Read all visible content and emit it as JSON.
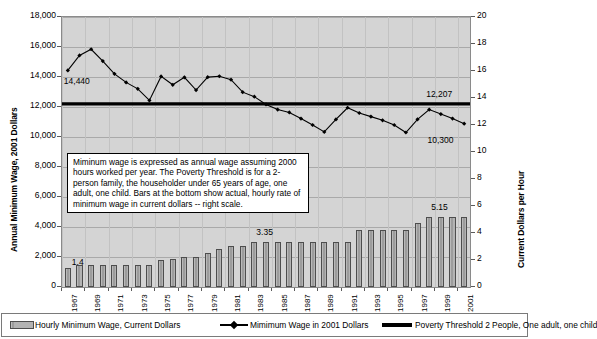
{
  "chart_data": {
    "type": "bar",
    "title": "",
    "xlabel": "",
    "ylabel": "Annual Minimum Wage, 2001 Dollars",
    "y2label": "Current Dollars per Hour",
    "ylim": [
      0,
      18000
    ],
    "y2lim": [
      0,
      20
    ],
    "grid": true,
    "legend_position": "bottom",
    "categories": [
      "1967",
      "1968",
      "1969",
      "1970",
      "1971",
      "1972",
      "1973",
      "1974",
      "1975",
      "1976",
      "1977",
      "1978",
      "1979",
      "1980",
      "1981",
      "1982",
      "1983",
      "1984",
      "1985",
      "1986",
      "1987",
      "1988",
      "1989",
      "1990",
      "1991",
      "1992",
      "1993",
      "1994",
      "1995",
      "1996",
      "1997",
      "1998",
      "1999",
      "2000",
      "2001"
    ],
    "x_tick_labels": [
      "1967",
      "1969",
      "1971",
      "1973",
      "1975",
      "1977",
      "1979",
      "1981",
      "1983",
      "1985",
      "1987",
      "1989",
      "1991",
      "1993",
      "1995",
      "1997",
      "1999",
      "2001"
    ],
    "y_tick_labels": [
      "0",
      "2,000",
      "4,000",
      "6,000",
      "8,000",
      "10,000",
      "12,000",
      "14,000",
      "16,000",
      "18,000"
    ],
    "y2_tick_labels": [
      "0",
      "2",
      "4",
      "6",
      "8",
      "10",
      "12",
      "14",
      "16",
      "18",
      "20"
    ],
    "series": [
      {
        "name": "Hourly Minimum Wage, Current Dollars",
        "type": "bar",
        "axis": "right",
        "color": "#a6a6a6",
        "values": [
          1.4,
          1.6,
          1.6,
          1.6,
          1.6,
          1.6,
          1.6,
          1.6,
          2.0,
          2.1,
          2.2,
          2.2,
          2.55,
          2.8,
          3.05,
          3.05,
          3.35,
          3.35,
          3.35,
          3.35,
          3.35,
          3.35,
          3.35,
          3.35,
          3.35,
          4.25,
          4.25,
          4.25,
          4.25,
          4.25,
          4.75,
          5.15,
          5.15,
          5.15,
          5.15
        ]
      },
      {
        "name": "Mimimum Wage in 2001 Dollars",
        "type": "line",
        "axis": "left",
        "color": "#000000",
        "values": [
          14440,
          15440,
          15850,
          15060,
          14210,
          13640,
          13210,
          12440,
          14040,
          13480,
          13980,
          13130,
          13990,
          14050,
          13820,
          12990,
          12690,
          12170,
          11830,
          11640,
          11230,
          10800,
          10340,
          11170,
          11950,
          11600,
          11360,
          11110,
          10800,
          10300,
          11180,
          11830,
          11530,
          11230,
          10890
        ]
      },
      {
        "name": "Poverty Threshold 2 People, One adult, one child",
        "type": "line",
        "axis": "left",
        "color": "#000000",
        "constant": 12207,
        "values": [
          12207,
          12207,
          12207,
          12207,
          12207,
          12207,
          12207,
          12207,
          12207,
          12207,
          12207,
          12207,
          12207,
          12207,
          12207,
          12207,
          12207,
          12207,
          12207,
          12207,
          12207,
          12207,
          12207,
          12207,
          12207,
          12207,
          12207,
          12207,
          12207,
          12207,
          12207,
          12207,
          12207,
          12207,
          12207
        ]
      }
    ],
    "annotations": [
      {
        "text": "14,440",
        "x": 0,
        "y": 14440,
        "place": "below-right"
      },
      {
        "text": "12,207",
        "x": 34,
        "y": 12207,
        "place": "above-left"
      },
      {
        "text": "10,300",
        "x": 29,
        "y": 10300,
        "place": "right"
      },
      {
        "text": "1.4",
        "x": 0,
        "y": 1.4,
        "axis": "right",
        "place": "above"
      },
      {
        "text": "3.35",
        "x": 16,
        "y": 3.35,
        "axis": "right",
        "place": "above"
      },
      {
        "text": "5.15",
        "x": 31,
        "y": 5.15,
        "axis": "right",
        "place": "above"
      }
    ],
    "note": "Miminum wage is expressed as annual wage assuming 2000 hours worked per year. The Poverty Threshold is for a 2-person family, the householder under 65 years of age, one adult, one child. Bars at the bottom show actual, hourly rate of minimum wage in current dollars -- right scale."
  },
  "legend": {
    "items": [
      {
        "label": "Hourly Minimum Wage, Current Dollars",
        "marker": "bar-swatch"
      },
      {
        "label": "Mimimum Wage in 2001 Dollars",
        "marker": "line-diamond-swatch"
      },
      {
        "label": "Poverty Threshold 2 People, One adult, one child",
        "marker": "thick-line-swatch"
      }
    ]
  }
}
